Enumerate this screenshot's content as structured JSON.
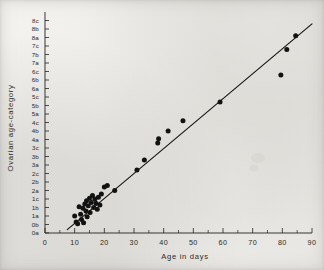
{
  "figure": {
    "background_color": "#f2f1ee",
    "ink_color": "#121210"
  },
  "chart_data": {
    "type": "scatter",
    "title": "",
    "subtitle": "",
    "xlabel": "Age in days",
    "ylabel": "Ovarian age-category",
    "xlim": [
      0,
      90
    ],
    "ylim": [
      0,
      26
    ],
    "grid": false,
    "legend": null,
    "x_major_ticks": [
      0,
      10,
      20,
      30,
      40,
      50,
      60,
      70,
      80,
      90
    ],
    "x_major_tick_labels": [
      "0",
      "10",
      "20",
      "30",
      "40",
      "50",
      "60",
      "70",
      "80",
      "90"
    ],
    "x_minor_ticks": [
      5,
      15,
      25,
      35,
      45,
      55,
      65,
      75,
      85
    ],
    "y_tick_labels": [
      "0a",
      "0b",
      "1a",
      "1b",
      "1c",
      "2a",
      "2b",
      "2c",
      "3a",
      "3b",
      "3c",
      "4a",
      "4b",
      "4c",
      "5a",
      "5b",
      "5c",
      "6a",
      "6b",
      "6c",
      "7a",
      "7b",
      "7c",
      "8a",
      "8b",
      "8c"
    ],
    "y_category_note": "Ordinal ovarian age-categories, index 0 = '0a' at bottom through index 25 = '8c' at top.",
    "points": [
      {
        "x": 10.0,
        "y": 2.0
      },
      {
        "x": 10.5,
        "y": 1.3
      },
      {
        "x": 11.0,
        "y": 1.1
      },
      {
        "x": 11.5,
        "y": 3.1
      },
      {
        "x": 12.0,
        "y": 2.2
      },
      {
        "x": 12.3,
        "y": 1.6
      },
      {
        "x": 12.8,
        "y": 2.9
      },
      {
        "x": 13.0,
        "y": 1.2
      },
      {
        "x": 13.4,
        "y": 3.4
      },
      {
        "x": 13.8,
        "y": 2.6
      },
      {
        "x": 14.0,
        "y": 3.8
      },
      {
        "x": 14.2,
        "y": 1.9
      },
      {
        "x": 14.6,
        "y": 3.2
      },
      {
        "x": 15.0,
        "y": 4.1
      },
      {
        "x": 15.2,
        "y": 2.4
      },
      {
        "x": 15.6,
        "y": 3.6
      },
      {
        "x": 16.0,
        "y": 4.4
      },
      {
        "x": 16.4,
        "y": 3.0
      },
      {
        "x": 16.8,
        "y": 4.0
      },
      {
        "x": 17.2,
        "y": 3.5
      },
      {
        "x": 17.6,
        "y": 2.8
      },
      {
        "x": 18.0,
        "y": 4.2
      },
      {
        "x": 18.5,
        "y": 3.3
      },
      {
        "x": 19.0,
        "y": 4.6
      },
      {
        "x": 20.0,
        "y": 5.4
      },
      {
        "x": 21.0,
        "y": 5.6
      },
      {
        "x": 23.5,
        "y": 5.0
      },
      {
        "x": 31.0,
        "y": 7.4
      },
      {
        "x": 33.5,
        "y": 8.6
      },
      {
        "x": 38.0,
        "y": 10.6
      },
      {
        "x": 38.3,
        "y": 11.1
      },
      {
        "x": 41.5,
        "y": 12.0
      },
      {
        "x": 46.5,
        "y": 13.2
      },
      {
        "x": 59.0,
        "y": 15.4
      },
      {
        "x": 79.5,
        "y": 18.6
      },
      {
        "x": 81.5,
        "y": 21.6
      },
      {
        "x": 84.5,
        "y": 23.2
      }
    ],
    "fit_line": {
      "label": "fitted regression line",
      "x_start": 7.5,
      "y_start": 0.4,
      "x_end": 90.0,
      "y_end": 24.6
    },
    "annotations": []
  }
}
